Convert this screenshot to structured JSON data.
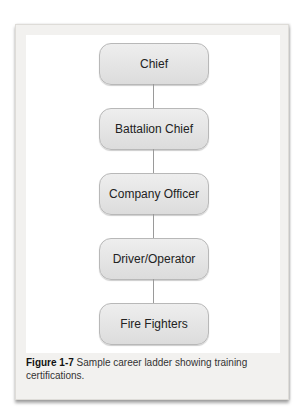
{
  "diagram": {
    "type": "career-ladder",
    "nodes": [
      {
        "label": "Chief"
      },
      {
        "label": "Battalion Chief"
      },
      {
        "label": "Company Officer"
      },
      {
        "label": "Driver/Operator"
      },
      {
        "label": "Fire Fighters"
      }
    ]
  },
  "caption": {
    "figure_label": "Figure 1-7",
    "text": " Sample career ladder showing training certifications."
  }
}
